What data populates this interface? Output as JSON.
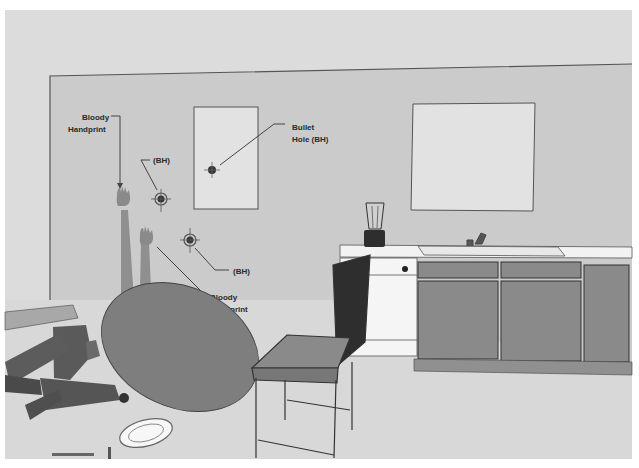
{
  "scene": {
    "title": "Crime scene kitchen reconstruction",
    "colors": {
      "background_frame": "#ffffff",
      "ceiling_floor": "#dcdcdc",
      "wall": "#cbcbcb",
      "window": "#e2e2e2",
      "table": "#7e7e7e",
      "cabinet": "#8a8a8a",
      "dark": "#2e2e2e",
      "blood": "#8f8f8f"
    }
  },
  "annotations": {
    "bloody_handprint_1": [
      "Bloody",
      "Handprint"
    ],
    "bullet_hole_upper_left": "(BH)",
    "bullet_hole_window": [
      "Bullet",
      "Hole (BH)"
    ],
    "bullet_hole_lower": "(BH)",
    "bloody_handprint_2": [
      "Bloody",
      "Handprint"
    ]
  },
  "objects": {
    "window_left": "window",
    "window_right": "window",
    "bullet_holes_count": 3,
    "handprints_count": 2,
    "furniture": [
      "overturned table",
      "chair",
      "kitchen counter",
      "sink",
      "blender",
      "dishwasher",
      "cabinets",
      "plate",
      "knife",
      "fork"
    ],
    "victim": "body on floor"
  }
}
